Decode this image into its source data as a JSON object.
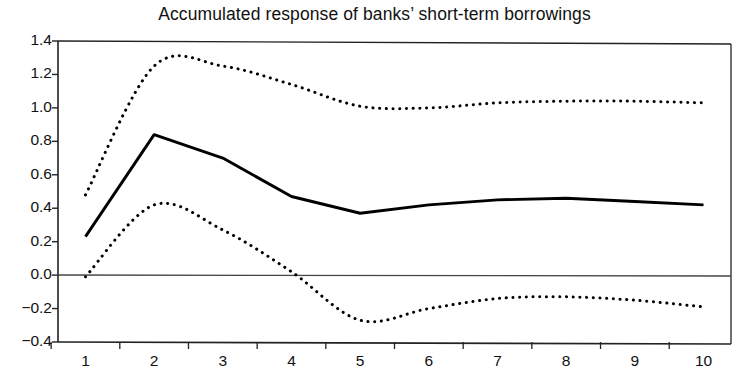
{
  "chart_data": {
    "type": "line",
    "title": "Accumulated response of banks’ short-term borrowings",
    "xlabel": "",
    "ylabel": "",
    "x": [
      1,
      2,
      3,
      4,
      5,
      6,
      7,
      8,
      9,
      10
    ],
    "xtick_labels": [
      "1",
      "2",
      "3",
      "4",
      "5",
      "6",
      "7",
      "8",
      "9",
      "10"
    ],
    "ytick_labels": [
      "1.4",
      "1.2",
      "1.0",
      "0.8",
      "0.6",
      "0.4",
      "0.2",
      "0.0",
      "−0.2",
      "−0.4"
    ],
    "ytick_values": [
      1.4,
      1.2,
      1.0,
      0.8,
      0.6,
      0.4,
      0.2,
      0.0,
      -0.2,
      -0.4
    ],
    "xlim": [
      0.6,
      10.4
    ],
    "ylim": [
      -0.4,
      1.4
    ],
    "grid": false,
    "legend": null,
    "zero_line": 0.0,
    "series": [
      {
        "name": "Accumulated response",
        "style": "solid",
        "color": "#000000",
        "values": [
          0.23,
          0.84,
          0.7,
          0.47,
          0.37,
          0.42,
          0.45,
          0.46,
          0.44,
          0.42
        ]
      },
      {
        "name": "Upper confidence band",
        "style": "dotted",
        "color": "#000000",
        "values": [
          0.48,
          1.25,
          1.25,
          1.14,
          1.01,
          1.0,
          1.03,
          1.04,
          1.04,
          1.03
        ]
      },
      {
        "name": "Lower confidence band",
        "style": "dotted",
        "color": "#000000",
        "values": [
          -0.01,
          0.42,
          0.27,
          0.02,
          -0.27,
          -0.2,
          -0.14,
          -0.13,
          -0.15,
          -0.19
        ]
      }
    ]
  },
  "figure": {
    "title": "Accumulated response of banks’ short-term borrowings",
    "background_color": "#ffffff",
    "axis_color": "#222222"
  }
}
